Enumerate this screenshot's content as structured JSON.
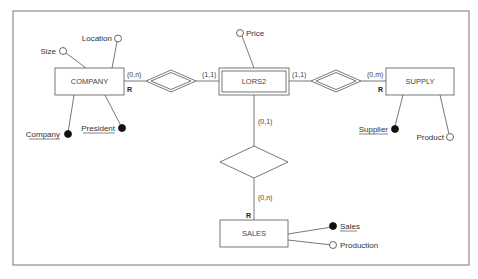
{
  "diagram": {
    "type": "ER diagram",
    "entities": [
      {
        "id": "company",
        "label": "COMPANY",
        "weak": false
      },
      {
        "id": "lors2",
        "label": "LORS2",
        "weak": true
      },
      {
        "id": "supply",
        "label": "SUPPLY",
        "weak": false
      },
      {
        "id": "sales",
        "label": "SALES",
        "weak": false
      }
    ],
    "attributes": {
      "company": [
        {
          "label": "Size",
          "key": false
        },
        {
          "label": "Location",
          "key": false
        },
        {
          "label": "Company",
          "key": true
        },
        {
          "label": "President",
          "key": true
        }
      ],
      "lors2": [
        {
          "label": "Price",
          "key": false
        }
      ],
      "supply": [
        {
          "label": "Supplier",
          "key": true
        },
        {
          "label": "Product",
          "key": false
        }
      ],
      "sales": [
        {
          "label": "Sales",
          "key": true
        },
        {
          "label": "Production",
          "key": false
        }
      ]
    },
    "cardinalities": {
      "company_rel": "(0,n)",
      "lors2_left": "(1,1)",
      "lors2_right": "(1,1)",
      "supply_rel": "(0,m)",
      "lors2_down": "(0,1)",
      "sales_rel": "(0,n)"
    },
    "role_marker": "R",
    "colors": {
      "line": "#555555",
      "text": "#333333",
      "key_fill": "#111111"
    }
  }
}
